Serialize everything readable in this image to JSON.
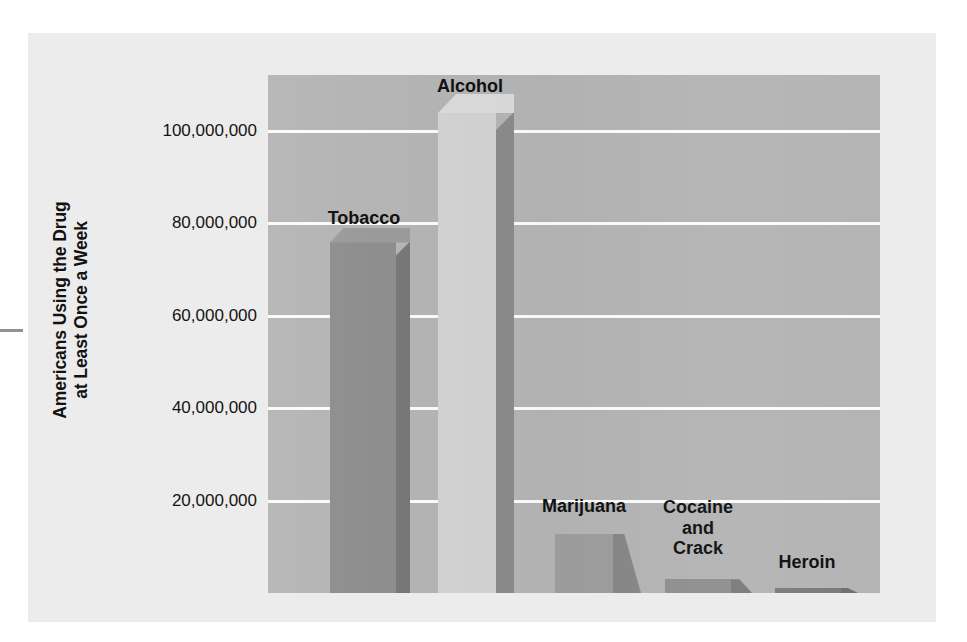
{
  "figure": {
    "background_color": "#ececec",
    "plot_background_color": "#b4b4b4",
    "gridline_color": "#fbfbfb"
  },
  "axis": {
    "title_line1": "Americans Using the Drug",
    "title_line2": "at Least Once a Week",
    "ticks": [
      {
        "label": "100,000,000",
        "value": 100000000
      },
      {
        "label": "80,000,000",
        "value": 80000000
      },
      {
        "label": "60,000,000",
        "value": 60000000
      },
      {
        "label": "40,000,000",
        "value": 40000000
      },
      {
        "label": "20,000,000",
        "value": 20000000
      }
    ]
  },
  "bars": [
    {
      "label": "Tobacco",
      "value": 76000000,
      "front_color": "#8e8e8e",
      "side_color": "#777777",
      "top_color": "#9a9a9a"
    },
    {
      "label": "Alcohol",
      "value": 104000000,
      "front_color": "#d2d2d2",
      "side_color": "#8b8b8b",
      "top_color": "#dadada"
    },
    {
      "label": "Marijuana",
      "value": 12800000,
      "front_color": "#9d9d9d",
      "side_color": "#868686",
      "top_color": "#a6a6a6"
    },
    {
      "label": "Cocaine\nand\nCrack",
      "value": 3000000,
      "front_color": "#8f8f8f",
      "side_color": "#7c7c7c",
      "top_color": "#999999"
    },
    {
      "label": "Heroin",
      "value": 700000,
      "front_color": "#7b7b7b",
      "side_color": "#6f6f6f",
      "top_color": "#858585"
    }
  ],
  "chart_data": {
    "type": "bar",
    "title": "",
    "subtitle": "",
    "xlabel": "",
    "ylabel": "Americans Using the Drug at Least Once a Week",
    "categories": [
      "Tobacco",
      "Alcohol",
      "Marijuana",
      "Cocaine and Crack",
      "Heroin"
    ],
    "values": [
      76000000,
      104000000,
      12800000,
      3000000,
      700000
    ],
    "ytick_labels": [
      "20,000,000",
      "40,000,000",
      "60,000,000",
      "80,000,000",
      "100,000,000"
    ],
    "ytick_values": [
      20000000,
      40000000,
      60000000,
      80000000,
      100000000
    ],
    "ylim": [
      0,
      112000000
    ],
    "grid": "horizontal-only",
    "legend": "none",
    "style": "3d-bars-grayscale",
    "annotations": [
      "Bar category names are drawn directly above each bar instead of on an x-axis."
    ]
  }
}
